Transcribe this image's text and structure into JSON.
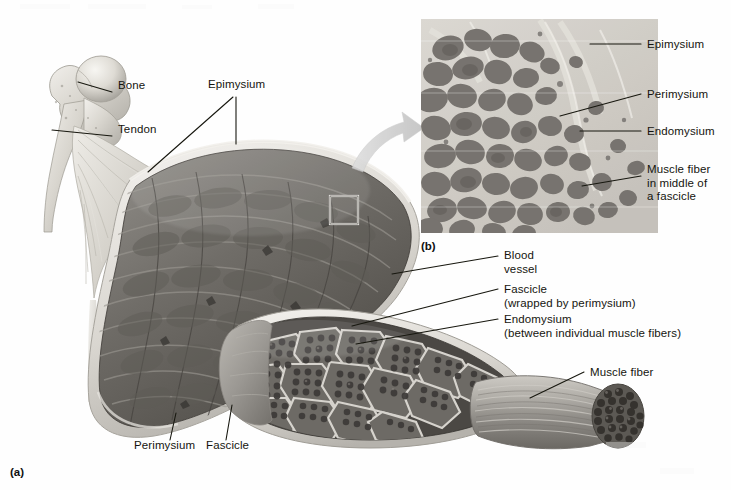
{
  "figure": {
    "background_color": "#fefefe",
    "text_color": "#15150f",
    "leader_color": "#17170f"
  },
  "panels": [
    {
      "id": "panel-a",
      "label": "(a)",
      "x": 10,
      "y": 466
    },
    {
      "id": "panel-b",
      "label": "(b)",
      "x": 421,
      "y": 240
    }
  ],
  "labels": {
    "bone": {
      "text": "Bone",
      "x": 118,
      "y": 86
    },
    "tendon": {
      "text": "Tendon",
      "x": 118,
      "y": 130
    },
    "epimysium_a": {
      "text": "Epimysium",
      "x": 208,
      "y": 85
    },
    "perimysium_a": {
      "text": "Perimysium",
      "x": 134,
      "y": 446
    },
    "fascicle_a": {
      "text": "Fascicle",
      "x": 206,
      "y": 446
    },
    "blood_vessel": {
      "text": "Blood\nvessel",
      "x": 504,
      "y": 249
    },
    "fascicle_wrapped": {
      "text": "Fascicle\n(wrapped by perimysium)",
      "x": 504,
      "y": 283
    },
    "endomysium_between": {
      "text": "Endomysium\n(between individual muscle fibers)",
      "x": 504,
      "y": 313
    },
    "muscle_fiber": {
      "text": "Muscle fiber",
      "x": 590,
      "y": 366
    },
    "epimysium_b": {
      "text": "Epimysium",
      "x": 647,
      "y": 38
    },
    "perimysium_b": {
      "text": "Perimysium",
      "x": 647,
      "y": 88
    },
    "endomysium_b": {
      "text": "Endomysium",
      "x": 647,
      "y": 125
    },
    "muscle_fiber_fascicle": {
      "text": "Muscle fiber\nin middle of\na fascicle",
      "x": 647,
      "y": 163
    }
  },
  "micrograph": {
    "name": "cross-section-micrograph",
    "x": 421,
    "y": 19,
    "width": 237,
    "height": 214,
    "base_color": "#cfcbc4",
    "fiber_color": "#6e6a66"
  },
  "callout_box": {
    "x": 330,
    "y": 196,
    "size": 28
  },
  "arrow": {
    "name": "magnify-arrow",
    "color": "#c9c9c9"
  },
  "palette": {
    "muscle_mid": "#6f6f6f",
    "muscle_dark": "#4a4a4a",
    "muscle_light": "#a9a9a9",
    "epimysium_sheath": "#e8e6e0",
    "bone": "#d8d5ce",
    "tendon": "#c9c6bf",
    "fiber_dark": "#58554f",
    "fiber_mid": "#7b7772"
  }
}
